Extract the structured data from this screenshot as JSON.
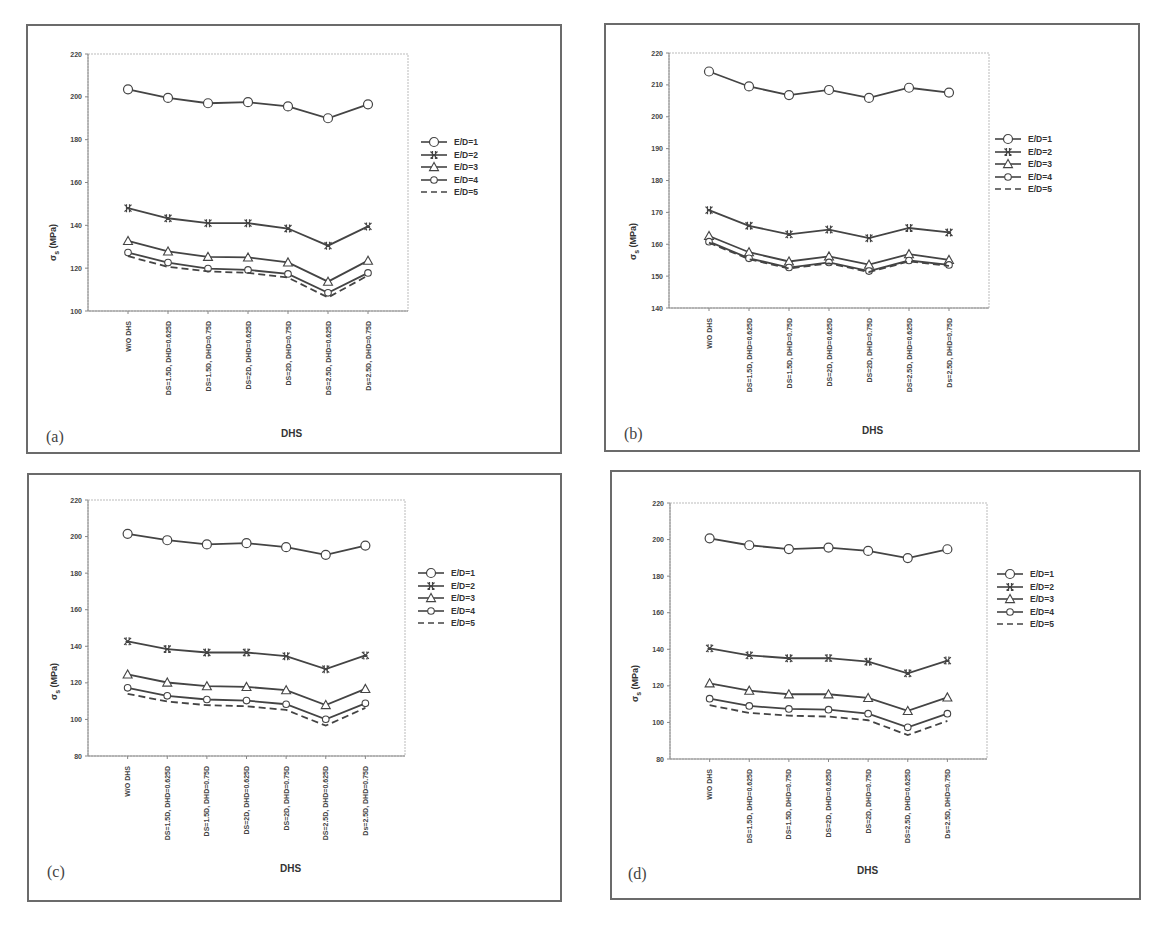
{
  "chart_data": [
    {
      "type": "line",
      "panel": "(a)",
      "title": "",
      "xlabel": "DHS",
      "ylabel": "σs (MPa)",
      "ylim": [
        100,
        220
      ],
      "yticks": [
        100,
        120,
        140,
        160,
        180,
        200,
        220
      ],
      "grid": false,
      "legend_position": "right",
      "categories": [
        "W/O DHS",
        "DS=1.5D, DHD=0.625D",
        "DS=1.5D, DHD=0.75D",
        "DS=2D, DHD=0.625D",
        "DS=2D, DHD=0.75D",
        "DS=2.5D, DHD=0.625D",
        "Ds=2.5D, DHD=0.75D"
      ],
      "series": [
        {
          "name": "E/D=1",
          "marker": "circle",
          "values": [
            203.5,
            199.5,
            197,
            197.5,
            195.5,
            190,
            196.5
          ]
        },
        {
          "name": "E/D=2",
          "marker": "x",
          "values": [
            148,
            143.3,
            141,
            141,
            138.5,
            130.5,
            139.5
          ]
        },
        {
          "name": "E/D=3",
          "marker": "triangle",
          "values": [
            132.7,
            127.8,
            125.3,
            125,
            122.7,
            113.7,
            123.5
          ]
        },
        {
          "name": "E/D=4",
          "marker": "small-circle",
          "values": [
            127.3,
            122.6,
            119.8,
            119.2,
            117.3,
            108.5,
            117.8
          ]
        },
        {
          "name": "E/D=5",
          "marker": "none",
          "dashed": true,
          "values": [
            125.6,
            120.6,
            118.5,
            117.8,
            115.6,
            106.3,
            116.6
          ]
        }
      ]
    },
    {
      "type": "line",
      "panel": "(b)",
      "title": "",
      "xlabel": "DHS",
      "ylabel": "σs (MPa)",
      "ylim": [
        140,
        220
      ],
      "yticks": [
        140,
        150,
        160,
        170,
        180,
        190,
        200,
        210,
        220
      ],
      "grid": false,
      "legend_position": "right",
      "categories": [
        "W/O DHS",
        "DS=1.5D, DHD=0.625D",
        "DS=1.5D, DHD=0.75D",
        "DS=2D, DHD=0.625D",
        "DS=2D, DHD=0.75D",
        "DS=2.5D, DHD=0.625D",
        "Ds=2.5D, DHD=0.75D"
      ],
      "series": [
        {
          "name": "E/D=1",
          "marker": "circle",
          "values": [
            214.2,
            209.5,
            206.8,
            208.4,
            205.9,
            209.1,
            207.6
          ]
        },
        {
          "name": "E/D=2",
          "marker": "x",
          "values": [
            170.7,
            165.8,
            163.1,
            164.6,
            161.9,
            165.1,
            163.7
          ]
        },
        {
          "name": "E/D=3",
          "marker": "triangle",
          "values": [
            162.6,
            157.5,
            154.6,
            156.2,
            153.6,
            156.9,
            155.1
          ]
        },
        {
          "name": "E/D=4",
          "marker": "small-circle",
          "values": [
            160.8,
            155.6,
            152.7,
            154.3,
            151.6,
            154.9,
            153.5
          ]
        },
        {
          "name": "E/D=5",
          "marker": "none",
          "dashed": true,
          "values": [
            160.5,
            155.3,
            152.4,
            154,
            151.3,
            154.6,
            153.2
          ]
        }
      ]
    },
    {
      "type": "line",
      "panel": "(c)",
      "title": "",
      "xlabel": "DHS",
      "ylabel": "σs (MPa)",
      "ylim": [
        80,
        220
      ],
      "yticks": [
        80,
        100,
        120,
        140,
        160,
        180,
        200,
        220
      ],
      "grid": false,
      "legend_position": "right",
      "categories": [
        "W/O DHS",
        "DS=1.5D, DHD=0.625D",
        "DS=1.5D, DHD=0.75D",
        "DS=2D, DHD=0.625D",
        "DS=2D, DHD=0.75D",
        "DS=2.5D, DHD=0.625D",
        "Ds=2.5D, DHD=0.75D"
      ],
      "series": [
        {
          "name": "E/D=1",
          "marker": "circle",
          "values": [
            201.5,
            198,
            195.7,
            196.4,
            194.2,
            190,
            195.1
          ]
        },
        {
          "name": "E/D=2",
          "marker": "x",
          "values": [
            142.7,
            138.5,
            136.6,
            136.6,
            134.6,
            127.5,
            135
          ]
        },
        {
          "name": "E/D=3",
          "marker": "triangle",
          "values": [
            124.6,
            120.2,
            118.2,
            117.8,
            116,
            107.9,
            116.7
          ]
        },
        {
          "name": "E/D=4",
          "marker": "small-circle",
          "values": [
            117.3,
            112.9,
            110.9,
            110.3,
            108.3,
            100.1,
            108.8
          ]
        },
        {
          "name": "E/D=5",
          "marker": "none",
          "dashed": true,
          "values": [
            114,
            109.8,
            107.8,
            107.2,
            105.2,
            96.6,
            106.3
          ]
        }
      ]
    },
    {
      "type": "line",
      "panel": "(d)",
      "title": "",
      "xlabel": "DHS",
      "ylabel": "σs (MPa)",
      "ylim": [
        80,
        220
      ],
      "yticks": [
        80,
        100,
        120,
        140,
        160,
        180,
        200,
        220
      ],
      "grid": false,
      "legend_position": "right",
      "categories": [
        "W/O DHS",
        "DS=1.5D, DHD=0.625D",
        "DS=1.5D, DHD=0.75D",
        "DS=2D, DHD=0.625D",
        "DS=2D, DHD=0.75D",
        "DS=2.5D, DHD=0.625D",
        "Ds=2.5D, DHD=0.75D"
      ],
      "series": [
        {
          "name": "E/D=1",
          "marker": "circle",
          "values": [
            200.7,
            196.9,
            194.8,
            195.6,
            193.8,
            189.9,
            194.7
          ]
        },
        {
          "name": "E/D=2",
          "marker": "x",
          "values": [
            140.5,
            136.7,
            135.1,
            135.2,
            133.2,
            126.9,
            133.8
          ]
        },
        {
          "name": "E/D=3",
          "marker": "triangle",
          "values": [
            121.4,
            117.4,
            115.4,
            115.4,
            113.4,
            106.3,
            113.7
          ]
        },
        {
          "name": "E/D=4",
          "marker": "small-circle",
          "values": [
            113,
            109,
            107.4,
            107,
            104.8,
            97.3,
            104.8
          ]
        },
        {
          "name": "E/D=5",
          "marker": "none",
          "dashed": true,
          "values": [
            109.4,
            105.2,
            103.7,
            103.2,
            101.2,
            93.1,
            100.8
          ]
        }
      ]
    }
  ],
  "panels": [
    {
      "label": "(a)",
      "xlabel": "DHS",
      "ylabel": "σs (MPa)"
    },
    {
      "label": "(b)",
      "xlabel": "DHS",
      "ylabel": "σs (MPa)"
    },
    {
      "label": "(c)",
      "xlabel": "DHS",
      "ylabel": "σs (MPa)"
    },
    {
      "label": "(d)",
      "xlabel": "DHS",
      "ylabel": "σs (MPa)"
    }
  ],
  "colors": {
    "line": "#444444",
    "marker_fill": "#ffffff",
    "frame": "#6b6b6b",
    "axis": "#888888"
  }
}
